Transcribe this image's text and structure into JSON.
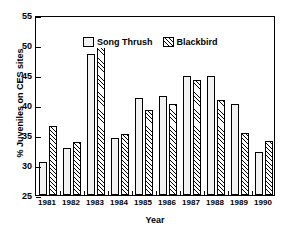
{
  "chart_data": {
    "type": "bar",
    "title": "",
    "xlabel": "Year",
    "ylabel": "% Juveniles on CES sites",
    "categories": [
      "1981",
      "1982",
      "1983",
      "1984",
      "1985",
      "1986",
      "1987",
      "1988",
      "1989",
      "1990"
    ],
    "ylim": [
      25,
      55
    ],
    "yticks": [
      25,
      30,
      35,
      40,
      45,
      50,
      55
    ],
    "grid": false,
    "legend_position": "top-left",
    "series": [
      {
        "name": "Song Thrush",
        "fill": "solid-light-gray",
        "values": [
          30.5,
          32.9,
          48.5,
          34.5,
          41.2,
          41.5,
          44.8,
          44.8,
          40.2,
          32.2
        ]
      },
      {
        "name": "Blackbird",
        "fill": "diagonal-hatch",
        "values": [
          36.5,
          33.8,
          50.3,
          35.2,
          39.2,
          40.2,
          44.1,
          40.8,
          35.3,
          34.0
        ]
      }
    ]
  },
  "axis": {
    "y_tick_labels": [
      "25",
      "30",
      "35",
      "40",
      "45",
      "50",
      "55"
    ],
    "x_tick_labels": [
      "1981",
      "1982",
      "1983",
      "1984",
      "1985",
      "1986",
      "1987",
      "1988",
      "1989",
      "1990"
    ],
    "y_axis_title": "% Juveniles on CES sites",
    "x_axis_title": "Year"
  },
  "legend": {
    "entries": [
      {
        "label": "Song Thrush",
        "swatch": "solid-light-gray"
      },
      {
        "label": "Blackbird",
        "swatch": "diagonal-hatch"
      }
    ]
  },
  "colors": {
    "axis": "#000000",
    "bar_song_thrush": "#f2f2f2",
    "bar_blackbird_hatch": "#000000",
    "background": "#ffffff"
  }
}
